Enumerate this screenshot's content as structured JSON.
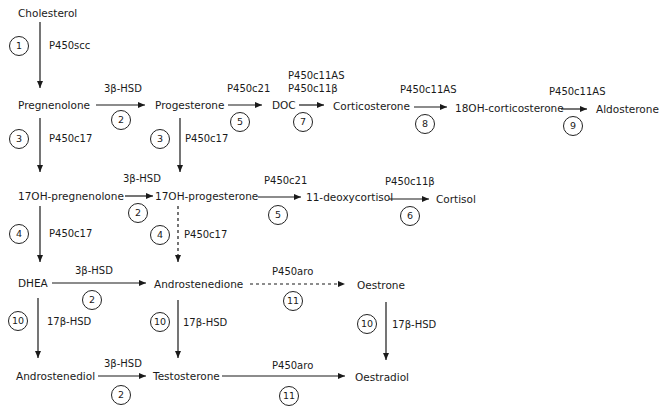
{
  "nodes": {
    "cholesterol": "Cholesterol",
    "pregnenolone": "Pregnenolone",
    "progesterone": "Progesterone",
    "doc": "DOC",
    "corticosterone": "Corticosterone",
    "oh18_corticosterone": "18OH-corticosterone",
    "aldosterone": "Aldosterone",
    "oh17_pregnenolone": "17OH-pregnenolone",
    "oh17_progesterone": "17OH-progesterone",
    "deoxycortisol": "11-deoxycortisol",
    "cortisol": "Cortisol",
    "dhea": "DHEA",
    "androstenedione": "Androstenedione",
    "oestrone": "Oestrone",
    "androstenediol": "Androstenediol",
    "testosterone": "Testosterone",
    "oestradiol": "Oestradiol"
  },
  "enzymes": {
    "p450scc": "P450scc",
    "hsd3b": "3β-HSD",
    "p450c17": "P450c17",
    "p450c21": "P450c21",
    "p450c11as": "P450c11AS",
    "p450c11b": "P450c11β",
    "p450aro": "P450aro",
    "hsd17b": "17β-HSD"
  },
  "steps": [
    "1",
    "2",
    "3",
    "4",
    "5",
    "6",
    "7",
    "8",
    "9",
    "10",
    "11"
  ]
}
